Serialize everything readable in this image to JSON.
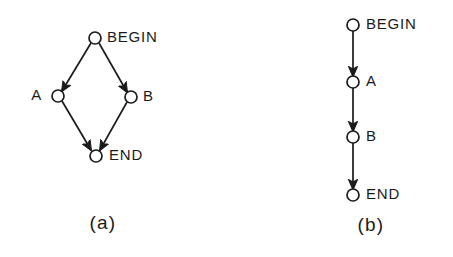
{
  "figure": {
    "type": "directed-graph-diagram",
    "background_color": "#ffffff",
    "ink_color": "#1b1b1b",
    "width": 453,
    "height": 257
  },
  "panels": [
    {
      "caption": "(a)",
      "caption_x": 103,
      "caption_y": 224,
      "structure": "parallel",
      "nodes": [
        {
          "id": "begin",
          "label": "BEGIN",
          "cx": 95,
          "cy": 38,
          "r": 6,
          "label_x": 107,
          "label_y": 38
        },
        {
          "id": "a",
          "label": "A",
          "cx": 58,
          "cy": 96,
          "r": 6,
          "label_x": 35,
          "label_y": 96
        },
        {
          "id": "b",
          "label": "B",
          "cx": 131,
          "cy": 97,
          "r": 6,
          "label_x": 144,
          "label_y": 97
        },
        {
          "id": "end",
          "label": "END",
          "cx": 96,
          "cy": 156,
          "r": 6,
          "label_x": 110,
          "label_y": 156
        }
      ],
      "edges": [
        {
          "from": "begin",
          "to": "a",
          "x1": 91,
          "y1": 43,
          "x2": 62,
          "y2": 91
        },
        {
          "from": "begin",
          "to": "b",
          "x1": 99,
          "y1": 43,
          "x2": 127,
          "y2": 92
        },
        {
          "from": "a",
          "to": "end",
          "x1": 62,
          "y1": 101,
          "x2": 91,
          "y2": 150
        },
        {
          "from": "b",
          "to": "end",
          "x1": 127,
          "y1": 102,
          "x2": 100,
          "y2": 150
        }
      ]
    },
    {
      "caption": "(b)",
      "caption_x": 371,
      "caption_y": 226,
      "structure": "sequential",
      "nodes": [
        {
          "id": "begin",
          "label": "BEGIN",
          "cx": 353,
          "cy": 25,
          "r": 6,
          "label_x": 371,
          "label_y": 25
        },
        {
          "id": "a",
          "label": "A",
          "cx": 353,
          "cy": 82,
          "r": 6,
          "label_x": 371,
          "label_y": 82
        },
        {
          "id": "b",
          "label": "B",
          "cx": 353,
          "cy": 137,
          "r": 6,
          "label_x": 371,
          "label_y": 137
        },
        {
          "id": "end",
          "label": "END",
          "cx": 353,
          "cy": 195,
          "r": 6,
          "label_x": 371,
          "label_y": 195
        }
      ],
      "edges": [
        {
          "from": "begin",
          "to": "a",
          "x1": 353,
          "y1": 31,
          "x2": 353,
          "y2": 76
        },
        {
          "from": "a",
          "to": "b",
          "x1": 353,
          "y1": 88,
          "x2": 353,
          "y2": 131
        },
        {
          "from": "b",
          "to": "end",
          "x1": 353,
          "y1": 143,
          "x2": 353,
          "y2": 189
        }
      ]
    }
  ]
}
